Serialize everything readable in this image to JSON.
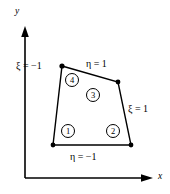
{
  "figure": {
    "background_color": "#ffffff",
    "line_color": "#000000"
  },
  "axes": {
    "y_label": "y",
    "x_label": "x",
    "origin_px": [
      25,
      178
    ],
    "y_tip_px": [
      25,
      27
    ],
    "x_tip_px": [
      153,
      178
    ]
  },
  "element": {
    "vertices_px": [
      [
        53,
        145
      ],
      [
        131,
        145
      ],
      [
        118,
        82
      ],
      [
        62,
        66
      ]
    ]
  },
  "edge_labels": {
    "xi_neg1": "ξ = −1",
    "eta_pos1": "η = 1",
    "xi_pos1": "ξ = 1",
    "eta_neg1": "η = −1"
  },
  "nodes": [
    {
      "label": "1",
      "cx": 68,
      "cy": 131
    },
    {
      "label": "2",
      "cx": 113,
      "cy": 131
    },
    {
      "label": "3",
      "cx": 93,
      "cy": 95
    },
    {
      "label": "4",
      "cx": 72,
      "cy": 80
    }
  ]
}
